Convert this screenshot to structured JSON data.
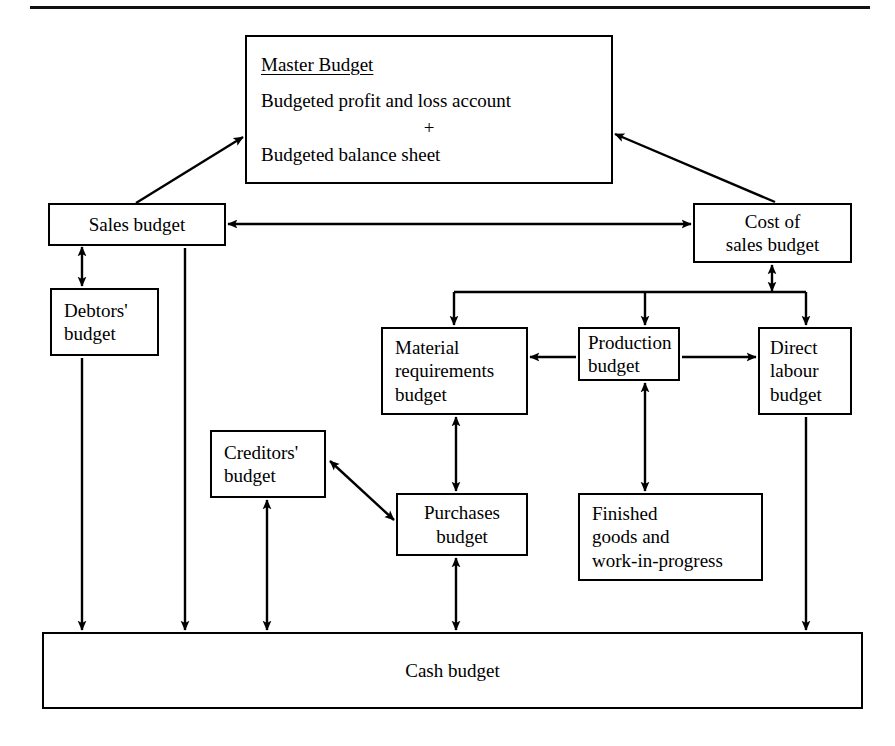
{
  "page": {
    "background_color": "#ffffff",
    "line_color": "#000000"
  },
  "rules": [
    {
      "name": "top-rule",
      "x": 30,
      "y": 6,
      "width": 840,
      "height": 3
    }
  ],
  "nodes": [
    {
      "id": "master-budget",
      "name": "master-budget-node",
      "lines": [
        "Master Budget",
        "Budgeted profit and loss account",
        "+",
        "Budgeted balance sheet"
      ],
      "underline_first": true,
      "x": 245,
      "y": 35,
      "width": 368,
      "height": 149,
      "font_size": 19,
      "align": "master"
    },
    {
      "id": "sales-budget",
      "name": "sales-budget-node",
      "lines": [
        "Sales budget"
      ],
      "x": 48,
      "y": 203,
      "width": 178,
      "height": 43,
      "font_size": 19,
      "align": "center"
    },
    {
      "id": "cost-of-sales-budget",
      "name": "cost-of-sales-budget-node",
      "lines": [
        "Cost of",
        "sales budget"
      ],
      "x": 693,
      "y": 203,
      "width": 159,
      "height": 60,
      "font_size": 19,
      "align": "center"
    },
    {
      "id": "debtors-budget",
      "name": "debtors-budget-node",
      "lines": [
        "Debtors'",
        "budget"
      ],
      "x": 50,
      "y": 288,
      "width": 109,
      "height": 68,
      "font_size": 19,
      "align": "left"
    },
    {
      "id": "material-requirements-budget",
      "name": "material-requirements-budget-node",
      "lines": [
        "Material",
        "requirements",
        "budget"
      ],
      "x": 381,
      "y": 327,
      "width": 147,
      "height": 88,
      "font_size": 19,
      "align": "left"
    },
    {
      "id": "production-budget",
      "name": "production-budget-node",
      "lines": [
        "Production",
        "budget"
      ],
      "x": 578,
      "y": 327,
      "width": 102,
      "height": 54,
      "font_size": 19,
      "align": "left"
    },
    {
      "id": "direct-labour-budget",
      "name": "direct-labour-budget-node",
      "lines": [
        "Direct",
        "labour",
        "budget"
      ],
      "x": 758,
      "y": 327,
      "width": 94,
      "height": 88,
      "font_size": 19,
      "align": "left"
    },
    {
      "id": "creditors-budget",
      "name": "creditors-budget-node",
      "lines": [
        "Creditors'",
        "budget"
      ],
      "x": 210,
      "y": 430,
      "width": 116,
      "height": 68,
      "font_size": 19,
      "align": "left"
    },
    {
      "id": "purchases-budget",
      "name": "purchases-budget-node",
      "lines": [
        "Purchases",
        "budget"
      ],
      "x": 396,
      "y": 493,
      "width": 132,
      "height": 63,
      "font_size": 19,
      "align": "center"
    },
    {
      "id": "finished-goods-wip",
      "name": "finished-goods-and-work-in-progress-node",
      "lines": [
        "Finished",
        "goods and",
        "work-in-progress"
      ],
      "x": 578,
      "y": 493,
      "width": 185,
      "height": 88,
      "font_size": 19,
      "align": "left"
    },
    {
      "id": "cash-budget",
      "name": "cash-budget-node",
      "lines": [
        "Cash budget"
      ],
      "x": 42,
      "y": 632,
      "width": 821,
      "height": 77,
      "font_size": 19,
      "align": "center"
    }
  ],
  "connectors": [
    {
      "id": "sales-to-master",
      "name": "connector-sales-budget-to-master-budget",
      "label": "Sales budget to Master Budget",
      "arrowheads": "end"
    },
    {
      "id": "cost-to-master",
      "name": "connector-cost-of-sales-to-master-budget",
      "label": "Cost of sales budget to Master Budget",
      "arrowheads": "end"
    },
    {
      "id": "sales-cost",
      "name": "connector-sales-budget-to-cost-of-sales",
      "label": "Sales budget and Cost of sales budget",
      "arrowheads": "both"
    },
    {
      "id": "sales-debtors",
      "name": "connector-sales-budget-to-debtors-budget",
      "label": "Sales budget and Debtors' budget",
      "arrowheads": "both"
    },
    {
      "id": "debtors-cash",
      "name": "connector-debtors-budget-to-cash-budget",
      "label": "Debtors' budget to Cash budget",
      "arrowheads": "end"
    },
    {
      "id": "sales-cash",
      "name": "connector-sales-budget-to-cash-budget",
      "label": "Sales budget to Cash budget",
      "arrowheads": "end"
    },
    {
      "id": "cost-bus",
      "name": "connector-cost-of-sales-distribution-bus",
      "label": "Cost of sales budget to Material, Production and Direct labour budgets",
      "arrowheads": "both-ends"
    },
    {
      "id": "production-material",
      "name": "connector-production-to-material-requirements",
      "label": "Production budget to Material requirements budget",
      "arrowheads": "end"
    },
    {
      "id": "production-labour",
      "name": "connector-production-to-direct-labour",
      "label": "Production budget to Direct labour budget",
      "arrowheads": "end"
    },
    {
      "id": "production-finished",
      "name": "connector-production-to-finished-goods",
      "label": "Production budget and Finished goods and work-in-progress",
      "arrowheads": "both"
    },
    {
      "id": "material-purchases",
      "name": "connector-material-requirements-to-purchases",
      "label": "Material requirements budget and Purchases budget",
      "arrowheads": "both"
    },
    {
      "id": "creditors-purchases",
      "name": "connector-creditors-to-purchases",
      "label": "Creditors' budget and Purchases budget",
      "arrowheads": "both"
    },
    {
      "id": "creditors-cash",
      "name": "connector-creditors-budget-to-cash-budget",
      "label": "Creditors' budget and Cash budget",
      "arrowheads": "both"
    },
    {
      "id": "purchases-cash",
      "name": "connector-purchases-budget-to-cash-budget",
      "label": "Purchases budget and Cash budget",
      "arrowheads": "both"
    },
    {
      "id": "labour-cash",
      "name": "connector-direct-labour-to-cash-budget",
      "label": "Direct labour budget to Cash budget",
      "arrowheads": "end"
    }
  ]
}
